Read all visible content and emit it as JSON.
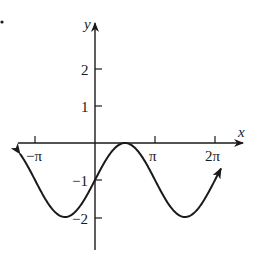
{
  "chart_data": {
    "type": "line",
    "title": "",
    "function": "y = sin(x) - 1",
    "xlabel": "x",
    "ylabel": "y",
    "x_ticks": [
      {
        "value": -3.14159,
        "label": "−π"
      },
      {
        "value": 3.14159,
        "label": "π"
      },
      {
        "value": 6.28318,
        "label": "2π"
      }
    ],
    "y_ticks": [
      {
        "value": 2,
        "label": "2"
      },
      {
        "value": 1,
        "label": "1"
      },
      {
        "value": -1,
        "label": "−1"
      },
      {
        "value": -2,
        "label": "−2"
      }
    ],
    "xlim": [
      -4.0,
      7.4
    ],
    "ylim": [
      -3.0,
      3.0
    ],
    "grid": false,
    "legend": null,
    "series": [
      {
        "name": "sin(x) - 1",
        "x": [
          -3.93,
          -3.14159,
          -2.356,
          -1.5708,
          -0.785,
          0,
          0.785,
          1.5708,
          2.356,
          3.14159,
          3.927,
          4.712,
          5.498,
          6.28318,
          6.6
        ],
        "y": [
          -0.29,
          -1.0,
          -1.707,
          -2.0,
          -1.707,
          -1.0,
          -0.293,
          0.0,
          -0.293,
          -1.0,
          -1.707,
          -2.0,
          -1.707,
          -1.0,
          -0.69
        ]
      }
    ],
    "annotations": [
      "arrowheads at both ends of curve",
      "arrowheads on positive x and y axes"
    ]
  },
  "axes": {
    "x_label": "x",
    "y_label": "y"
  },
  "marks": {
    "corner_dot": "•"
  },
  "colors": {
    "ink": "#1a1a1a",
    "background": "#ffffff"
  }
}
